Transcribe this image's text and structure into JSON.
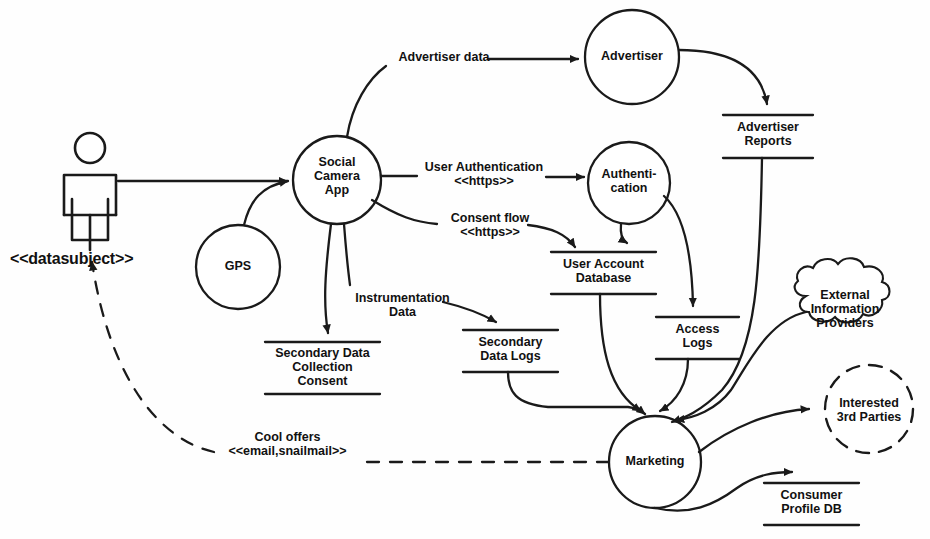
{
  "diagram": {
    "stroke_color": "#1a1a1a",
    "text_color": "#111111",
    "background": "#fefefe"
  },
  "actor": {
    "name": "stick-figure-actor",
    "label": "<<datasubject>>"
  },
  "processes": [
    {
      "id": "social_camera_app",
      "label": "Social\nCamera\nApp",
      "cx": 337,
      "cy": 180,
      "r": 44
    },
    {
      "id": "gps",
      "label": "GPS",
      "cx": 238,
      "cy": 267,
      "r": 42
    },
    {
      "id": "advertiser",
      "label": "Advertiser",
      "cx": 632,
      "cy": 57,
      "r": 47
    },
    {
      "id": "authentication",
      "label": "Authenti-\ncation",
      "cx": 629,
      "cy": 183,
      "r": 41
    },
    {
      "id": "marketing",
      "label": "Marketing",
      "cx": 655,
      "cy": 462,
      "r": 46
    }
  ],
  "data_stores": [
    {
      "id": "advertiser_reports",
      "label": "Advertiser\nReports",
      "x": 723,
      "y": 115,
      "w": 90,
      "h": 43
    },
    {
      "id": "user_account_db",
      "label": "User Account\nDatabase",
      "x": 551,
      "y": 252,
      "w": 105,
      "h": 42
    },
    {
      "id": "access_logs",
      "label": "Access\nLogs",
      "x": 656,
      "y": 317,
      "w": 83,
      "h": 42
    },
    {
      "id": "secondary_data_logs",
      "label": "Secondary\nData Logs",
      "x": 463,
      "y": 330,
      "w": 95,
      "h": 42
    },
    {
      "id": "secondary_consent",
      "label": "Secondary Data\nCollection\nConsent",
      "x": 265,
      "y": 342,
      "w": 115,
      "h": 52
    },
    {
      "id": "consumer_profile_db",
      "label": "Consumer\nProfile DB",
      "x": 764,
      "y": 483,
      "w": 95,
      "h": 42
    }
  ],
  "external_entities": [
    {
      "id": "external_info_providers",
      "label": "External\nInformation\nProviders",
      "shape": "cloud",
      "cx": 845,
      "cy": 311
    },
    {
      "id": "interested_3rd_parties",
      "label": "Interested\n3rd Parties",
      "shape": "dashed-circle",
      "cx": 869,
      "cy": 409,
      "r": 44
    }
  ],
  "flows": [
    {
      "id": "user_to_app",
      "label": "",
      "from": "datasubject",
      "to": "social_camera_app"
    },
    {
      "id": "gps_to_app",
      "label": "",
      "from": "gps",
      "to": "social_camera_app"
    },
    {
      "id": "advertiser_data",
      "label": "Advertiser data",
      "from": "social_camera_app",
      "to": "advertiser",
      "lx": 389,
      "ly": 50,
      "lw": 110
    },
    {
      "id": "user_authentication",
      "label": "User Authentication\n<<https>>",
      "from": "social_camera_app",
      "to": "authentication",
      "lx": 419,
      "ly": 160,
      "lw": 130
    },
    {
      "id": "consent_flow",
      "label": "Consent flow\n<<https>>",
      "from": "social_camera_app",
      "to": "user_account_db",
      "lx": 440,
      "ly": 211,
      "lw": 100
    },
    {
      "id": "instrumentation_data",
      "label": "Instrumentation\nData",
      "from": "social_camera_app",
      "to": "secondary_data_logs",
      "lx": 345,
      "ly": 291,
      "lw": 115
    },
    {
      "id": "app_to_consent_store",
      "label": "",
      "from": "social_camera_app",
      "to": "secondary_consent"
    },
    {
      "id": "advertiser_to_reports",
      "label": "",
      "from": "advertiser",
      "to": "advertiser_reports"
    },
    {
      "id": "auth_to_user_db",
      "label": "",
      "from": "authentication",
      "to": "user_account_db"
    },
    {
      "id": "auth_to_access_logs",
      "label": "",
      "from": "authentication",
      "to": "access_logs"
    },
    {
      "id": "reports_to_marketing",
      "label": "",
      "from": "advertiser_reports",
      "to": "marketing"
    },
    {
      "id": "userdb_to_marketing",
      "label": "",
      "from": "user_account_db",
      "to": "marketing"
    },
    {
      "id": "accesslogs_to_marketing",
      "label": "",
      "from": "access_logs",
      "to": "marketing"
    },
    {
      "id": "seclogs_to_marketing",
      "label": "",
      "from": "secondary_data_logs",
      "to": "marketing"
    },
    {
      "id": "external_to_marketing",
      "label": "",
      "from": "external_info_providers",
      "to": "marketing"
    },
    {
      "id": "marketing_to_3rd",
      "label": "",
      "from": "marketing",
      "to": "interested_3rd_parties"
    },
    {
      "id": "marketing_to_profiledb",
      "label": "",
      "from": "marketing",
      "to": "consumer_profile_db"
    },
    {
      "id": "cool_offers",
      "label": "Cool offers\n<<email,snailmail>>",
      "from": "marketing",
      "to": "datasubject",
      "lx": 215,
      "ly": 430,
      "lw": 145,
      "style": "dashed"
    }
  ]
}
